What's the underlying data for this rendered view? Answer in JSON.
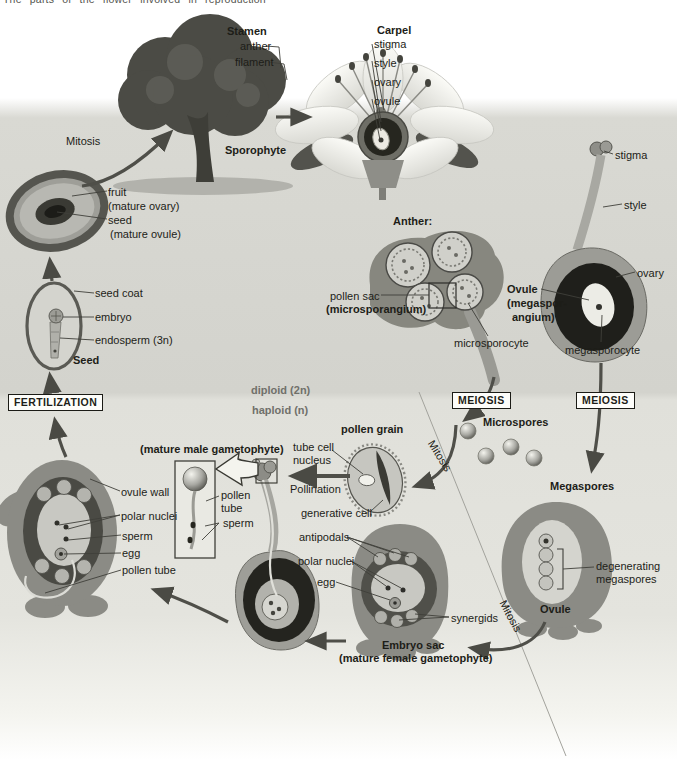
{
  "caption": "The parts of the flower involved in reproduction",
  "palette": {
    "panel_gray": "#d3d3cd",
    "haploid_gray": "#e4e4de",
    "ink": "#1d1d18",
    "muted_ink": "#70706a",
    "arrow_gray": "#4f4f49",
    "drawing_gray": "#8b8b85"
  },
  "labels": [
    {
      "id": "mitosis-tree",
      "text": "Mitosis",
      "x": 66,
      "y": 135
    },
    {
      "id": "sporophyte",
      "text": "Sporophyte",
      "x": 225,
      "y": 144,
      "bold": true
    },
    {
      "id": "stamen",
      "text": "Stamen",
      "x": 227,
      "y": 25,
      "bold": true
    },
    {
      "id": "anther-flower",
      "text": "anther",
      "x": 240,
      "y": 40
    },
    {
      "id": "filament",
      "text": "filament",
      "x": 235,
      "y": 56
    },
    {
      "id": "carpel",
      "text": "Carpel",
      "x": 377,
      "y": 24,
      "bold": true
    },
    {
      "id": "stigma-flower",
      "text": "stigma",
      "x": 374,
      "y": 38
    },
    {
      "id": "style-flower",
      "text": "style",
      "x": 374,
      "y": 57
    },
    {
      "id": "ovary-flower",
      "text": "ovary",
      "x": 374,
      "y": 76
    },
    {
      "id": "ovule-flower",
      "text": "ovule",
      "x": 374,
      "y": 95
    },
    {
      "id": "fruit",
      "text": "fruit",
      "x": 108,
      "y": 186
    },
    {
      "id": "fruit-sub",
      "text": "(mature ovary)",
      "x": 108,
      "y": 200
    },
    {
      "id": "seed-line",
      "text": "seed",
      "x": 108,
      "y": 214
    },
    {
      "id": "seed-sub",
      "text": "(mature ovule)",
      "x": 110,
      "y": 228
    },
    {
      "id": "seed-coat",
      "text": "seed coat",
      "x": 95,
      "y": 287
    },
    {
      "id": "embryo",
      "text": "embryo",
      "x": 95,
      "y": 311
    },
    {
      "id": "endosperm",
      "text": "endosperm (3n)",
      "x": 95,
      "y": 334
    },
    {
      "id": "seed-cap",
      "text": "Seed",
      "x": 73,
      "y": 354,
      "bold": true
    },
    {
      "id": "fertilization",
      "text": "FERTILIZATION",
      "x": 8,
      "y": 394,
      "boxed": true
    },
    {
      "id": "diploid",
      "text": "diploid (2n)",
      "x": 251,
      "y": 384,
      "bold": true,
      "muted": true
    },
    {
      "id": "haploid",
      "text": "haploid (n)",
      "x": 252,
      "y": 404,
      "bold": true,
      "muted": true
    },
    {
      "id": "anther-cap",
      "text": "Anther:",
      "x": 393,
      "y": 215,
      "bold": true
    },
    {
      "id": "pollen-sac",
      "text": "pollen sac",
      "x": 330,
      "y": 290
    },
    {
      "id": "microsporangium",
      "text": "(microsporangium)",
      "x": 326,
      "y": 303,
      "bold": true
    },
    {
      "id": "microsporocyte",
      "text": "microsporocyte",
      "x": 454,
      "y": 337
    },
    {
      "id": "stigma-carpel",
      "text": "stigma",
      "x": 615,
      "y": 149
    },
    {
      "id": "style-carpel",
      "text": "style",
      "x": 624,
      "y": 199
    },
    {
      "id": "ovary-carpel",
      "text": "ovary",
      "x": 637,
      "y": 267
    },
    {
      "id": "ovule-meg-1",
      "text": "Ovule",
      "x": 507,
      "y": 283,
      "bold": true
    },
    {
      "id": "ovule-meg-2",
      "text": "(megaspor-",
      "x": 507,
      "y": 297,
      "bold": true
    },
    {
      "id": "ovule-meg-3",
      "text": "angium)",
      "x": 512,
      "y": 311,
      "bold": true
    },
    {
      "id": "megasporocyte",
      "text": "megasporocyte",
      "x": 565,
      "y": 344
    },
    {
      "id": "meiosis-left",
      "text": "MEIOSIS",
      "x": 452,
      "y": 392,
      "boxed": true
    },
    {
      "id": "meiosis-right",
      "text": "MEIOSIS",
      "x": 576,
      "y": 392,
      "boxed": true
    },
    {
      "id": "microspores",
      "text": "Microspores",
      "x": 483,
      "y": 416,
      "bold": true
    },
    {
      "id": "mitosis-mid",
      "text": "Mitosis",
      "x": 436,
      "y": 438,
      "rotate": 58
    },
    {
      "id": "pollen-grain",
      "text": "pollen grain",
      "x": 341,
      "y": 423,
      "bold": true
    },
    {
      "id": "tube-cell",
      "text": "tube cell",
      "x": 293,
      "y": 441
    },
    {
      "id": "nucleus",
      "text": "nucleus",
      "x": 293,
      "y": 454
    },
    {
      "id": "pollination",
      "text": "Pollination",
      "x": 290,
      "y": 483
    },
    {
      "id": "generative-cell",
      "text": "generative cell",
      "x": 301,
      "y": 507
    },
    {
      "id": "mature-male",
      "text": "(mature male gametophyte)",
      "x": 140,
      "y": 443,
      "bold": true
    },
    {
      "id": "pollen-tube-inset-1",
      "text": "pollen",
      "x": 221,
      "y": 489
    },
    {
      "id": "pollen-tube-inset-2",
      "text": "tube",
      "x": 221,
      "y": 502
    },
    {
      "id": "sperm-inset",
      "text": "sperm",
      "x": 223,
      "y": 517
    },
    {
      "id": "ovule-wall",
      "text": "ovule wall",
      "x": 121,
      "y": 486
    },
    {
      "id": "polar-nuclei-left",
      "text": "polar nuclei",
      "x": 121,
      "y": 510
    },
    {
      "id": "sperm-left",
      "text": "sperm",
      "x": 122,
      "y": 530
    },
    {
      "id": "egg-left",
      "text": "egg",
      "x": 122,
      "y": 547
    },
    {
      "id": "pollen-tube-left",
      "text": "pollen tube",
      "x": 122,
      "y": 564
    },
    {
      "id": "antipodals",
      "text": "antipodals",
      "x": 299,
      "y": 531
    },
    {
      "id": "polar-nuclei-center",
      "text": "polar nuclei",
      "x": 298,
      "y": 555
    },
    {
      "id": "egg-center",
      "text": "egg",
      "x": 317,
      "y": 576
    },
    {
      "id": "synergids",
      "text": "synergids",
      "x": 451,
      "y": 612
    },
    {
      "id": "embryo-sac",
      "text": "Embryo sac",
      "x": 382,
      "y": 639,
      "bold": true
    },
    {
      "id": "mature-female",
      "text": "(mature female gametophyte)",
      "x": 339,
      "y": 652,
      "bold": true
    },
    {
      "id": "megaspores",
      "text": "Megaspores",
      "x": 550,
      "y": 480,
      "bold": true
    },
    {
      "id": "degenerating-1",
      "text": "degenerating",
      "x": 596,
      "y": 560
    },
    {
      "id": "degenerating-2",
      "text": "megaspores",
      "x": 596,
      "y": 573
    },
    {
      "id": "ovule-bottom",
      "text": "Ovule",
      "x": 540,
      "y": 603,
      "bold": true
    },
    {
      "id": "mitosis-bottom",
      "text": "Mitosis",
      "x": 508,
      "y": 598,
      "rotate": 62
    }
  ]
}
